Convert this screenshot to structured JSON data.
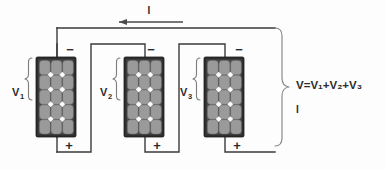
{
  "diagram": {
    "canvas": {
      "width": 386,
      "height": 170,
      "background": "#fdfdfd"
    },
    "current_label": "I",
    "equation": "V=V₁+V₂+V₃",
    "current_result_label": "I",
    "colors": {
      "wire": "#3a3a3a",
      "brace": "#8a8a8a",
      "panel_frame": "#2e2e2e",
      "cell": "#9a9a9a",
      "cell_gap": "#fbfbfb",
      "text": "#2b2b2b",
      "background": "#fdfdfd"
    },
    "panels": [
      {
        "id": "panel-1",
        "voltage_label": "V",
        "voltage_subscript": "1",
        "negative_terminal": "−",
        "positive_terminal": "+",
        "x": 36,
        "y": 57,
        "width": 40,
        "height": 80,
        "cell_cols": 3,
        "cell_rows": 5
      },
      {
        "id": "panel-2",
        "voltage_label": "V",
        "voltage_subscript": "2",
        "negative_terminal": "−",
        "positive_terminal": "+",
        "x": 124,
        "y": 57,
        "width": 40,
        "height": 80,
        "cell_cols": 3,
        "cell_rows": 5
      },
      {
        "id": "panel-3",
        "voltage_label": "V",
        "voltage_subscript": "3",
        "negative_terminal": "−",
        "positive_terminal": "+",
        "x": 204,
        "y": 57,
        "width": 40,
        "height": 80,
        "cell_cols": 3,
        "cell_rows": 5
      }
    ]
  }
}
